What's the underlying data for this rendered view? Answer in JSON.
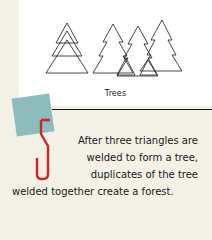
{
  "figure": {
    "caption": "Trees",
    "illustration_left": "three-stacked-triangles",
    "illustration_right": "forest-of-welded-trees"
  },
  "step": {
    "number": "5",
    "accent_color": "#d2232a",
    "square_color": "#8cbcbb",
    "text_lines": [
      "After three triangles are",
      "welded to form a tree,",
      "duplicates of the tree",
      "welded together create a forest."
    ]
  }
}
